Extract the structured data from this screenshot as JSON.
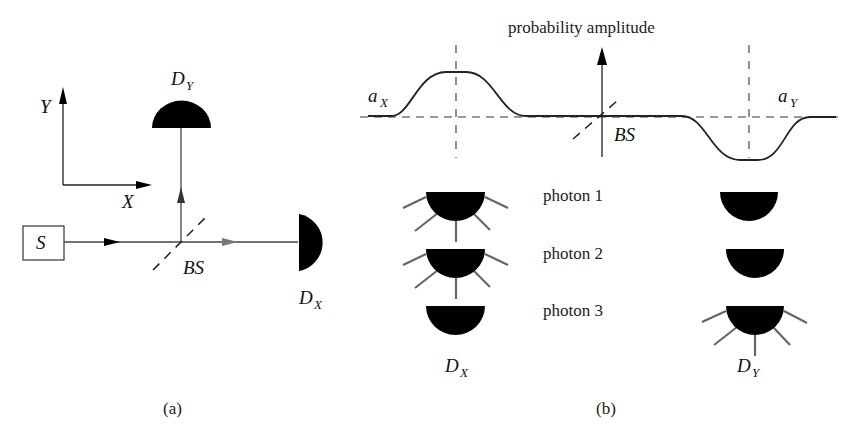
{
  "panel_a": {
    "caption": "(a)",
    "axes": {
      "y_label": "Y",
      "x_label": "X"
    },
    "source": {
      "label": "S"
    },
    "beam_splitter": {
      "label": "BS"
    },
    "detector_y": {
      "label": "D",
      "subscript": "Y"
    },
    "detector_x": {
      "label": "D",
      "subscript": "X"
    }
  },
  "panel_b": {
    "caption": "(b)",
    "axis_title": "probability amplitude",
    "beam_splitter": {
      "label": "BS"
    },
    "amplitude_x": {
      "label": "a",
      "subscript": "X"
    },
    "amplitude_y": {
      "label": "a",
      "subscript": "Y"
    },
    "photons": [
      {
        "label": "photon 1",
        "fires": "X"
      },
      {
        "label": "photon 2",
        "fires": "X"
      },
      {
        "label": "photon 3",
        "fires": "Y"
      }
    ],
    "detector_x": {
      "label": "D",
      "subscript": "X"
    },
    "detector_y": {
      "label": "D",
      "subscript": "Y"
    }
  },
  "colors": {
    "ink": "#000000",
    "line": "#333333",
    "gray_arrow": "#777777",
    "rays": "#666666"
  }
}
